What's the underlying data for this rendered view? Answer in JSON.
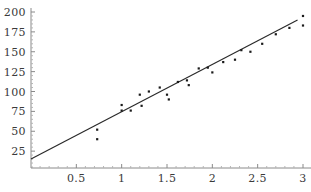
{
  "chart_data": {
    "type": "scatter",
    "title": "",
    "xlabel": "",
    "ylabel": "",
    "xlim": [
      0,
      3.08
    ],
    "ylim": [
      0,
      207
    ],
    "grid": false,
    "legend": null,
    "xticks": [
      0.5,
      1,
      1.5,
      2,
      2.5,
      3
    ],
    "xtick_labels": [
      "0.5",
      "1",
      "1.5",
      "2",
      "2.5",
      "3"
    ],
    "yticks": [
      25,
      50,
      75,
      100,
      125,
      150,
      175,
      200
    ],
    "ytick_labels": [
      "25",
      "50",
      "75",
      "100",
      "125",
      "150",
      "175",
      "200"
    ],
    "minor_tick_step_x": 0.1,
    "minor_tick_step_y": 5,
    "series": [
      {
        "name": "data points",
        "type": "scatter",
        "marker": "point",
        "color": "#1a1a1a",
        "points": [
          [
            0.73,
            52
          ],
          [
            0.73,
            40
          ],
          [
            1.0,
            83
          ],
          [
            1.0,
            76
          ],
          [
            1.1,
            76
          ],
          [
            1.2,
            96
          ],
          [
            1.22,
            82
          ],
          [
            1.3,
            100
          ],
          [
            1.42,
            105
          ],
          [
            1.5,
            96
          ],
          [
            1.52,
            90
          ],
          [
            1.62,
            112
          ],
          [
            1.72,
            114
          ],
          [
            1.74,
            108
          ],
          [
            1.85,
            129
          ],
          [
            1.95,
            130
          ],
          [
            2.0,
            124
          ],
          [
            2.12,
            137
          ],
          [
            2.25,
            140
          ],
          [
            2.32,
            152
          ],
          [
            2.42,
            150
          ],
          [
            2.55,
            160
          ],
          [
            2.7,
            172
          ],
          [
            2.85,
            180
          ],
          [
            3.0,
            195
          ],
          [
            3.0,
            183
          ]
        ]
      },
      {
        "name": "fit line",
        "type": "line",
        "color": "#2a2a2a",
        "x": [
          0.0,
          2.94
        ],
        "y": [
          15,
          190
        ]
      }
    ]
  }
}
